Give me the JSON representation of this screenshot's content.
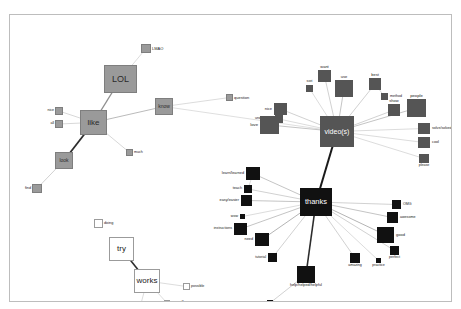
{
  "window": {
    "ghost_text_left": "",
    "ghost_text_right": ""
  },
  "chart_data": {
    "type": "scatter",
    "title": "",
    "subtitle": "",
    "xlabel": "",
    "ylabel": "",
    "legend_position": "none",
    "grid": false,
    "clusters": [
      {
        "id": "grey",
        "name": "grey-cluster",
        "color": "#9a9a9a",
        "hub": "like"
      },
      {
        "id": "darkgrey",
        "name": "dark-grey-cluster",
        "color": "#555555",
        "hub": "video(s)"
      },
      {
        "id": "black",
        "name": "black-cluster",
        "color": "#111111",
        "hub": "thanks"
      },
      {
        "id": "white",
        "name": "white-cluster",
        "color": "#ffffff",
        "hub": "works"
      }
    ],
    "nodes": [
      {
        "id": "lmao",
        "label": "LMAO",
        "x": 131,
        "y": 29,
        "w": 10,
        "h": 9,
        "cluster": "grey",
        "label_pos": "right",
        "fs": 4.0
      },
      {
        "id": "lol",
        "label": "LOL",
        "x": 94,
        "y": 50,
        "w": 33,
        "h": 28,
        "cluster": "grey",
        "label_pos": "inside",
        "fs": 9.0
      },
      {
        "id": "like",
        "label": "like",
        "x": 70,
        "y": 95,
        "w": 27,
        "h": 25,
        "cluster": "grey",
        "label_pos": "inside",
        "fs": 8.0
      },
      {
        "id": "know",
        "label": "know",
        "x": 145,
        "y": 83,
        "w": 18,
        "h": 17,
        "cluster": "grey",
        "label_pos": "inside",
        "fs": 5.0
      },
      {
        "id": "question",
        "label": "question",
        "x": 216,
        "y": 79,
        "w": 7,
        "h": 7,
        "cluster": "grey",
        "label_pos": "right",
        "fs": 4.0
      },
      {
        "id": "nice_left",
        "label": "nice",
        "x": 45,
        "y": 92,
        "w": 8,
        "h": 8,
        "cluster": "grey",
        "label_pos": "left",
        "fs": 3.6
      },
      {
        "id": "all",
        "label": "all",
        "x": 45,
        "y": 105,
        "w": 8,
        "h": 8,
        "cluster": "grey",
        "label_pos": "left",
        "fs": 3.6
      },
      {
        "id": "much",
        "label": "much",
        "x": 116,
        "y": 134,
        "w": 7,
        "h": 7,
        "cluster": "grey",
        "label_pos": "right",
        "fs": 3.6
      },
      {
        "id": "look",
        "label": "look",
        "x": 45,
        "y": 137,
        "w": 18,
        "h": 17,
        "cluster": "grey",
        "label_pos": "inside",
        "fs": 5.0
      },
      {
        "id": "find",
        "label": "find",
        "x": 22,
        "y": 169,
        "w": 10,
        "h": 9,
        "cluster": "grey",
        "label_pos": "left",
        "fs": 3.8
      },
      {
        "id": "videos",
        "label": "video(s)",
        "x": 310,
        "y": 101,
        "w": 34,
        "h": 31,
        "cluster": "darkgrey",
        "label_pos": "inside",
        "fs": 7.0
      },
      {
        "id": "want",
        "label": "want",
        "x": 308,
        "y": 55,
        "w": 13,
        "h": 12,
        "cluster": "darkgrey",
        "label_pos": "top",
        "fs": 4.0
      },
      {
        "id": "use",
        "label": "use",
        "x": 325,
        "y": 65,
        "w": 18,
        "h": 17,
        "cluster": "darkgrey",
        "label_pos": "top",
        "fs": 4.0
      },
      {
        "id": "sori",
        "label": "sori",
        "x": 296,
        "y": 70,
        "w": 7,
        "h": 7,
        "cluster": "darkgrey",
        "label_pos": "top",
        "fs": 3.6
      },
      {
        "id": "best",
        "label": "best",
        "x": 359,
        "y": 63,
        "w": 12,
        "h": 12,
        "cluster": "darkgrey",
        "label_pos": "top",
        "fs": 4.0
      },
      {
        "id": "method",
        "label": "method",
        "x": 371,
        "y": 78,
        "w": 7,
        "h": 7,
        "cluster": "darkgrey",
        "label_pos": "right",
        "fs": 3.6
      },
      {
        "id": "show",
        "label": "show",
        "x": 378,
        "y": 89,
        "w": 12,
        "h": 12,
        "cluster": "darkgrey",
        "label_pos": "top",
        "fs": 4.0
      },
      {
        "id": "people",
        "label": "people",
        "x": 397,
        "y": 84,
        "w": 19,
        "h": 18,
        "cluster": "darkgrey",
        "label_pos": "top",
        "fs": 4.2
      },
      {
        "id": "solve",
        "label": "solve/solved",
        "x": 408,
        "y": 108,
        "w": 12,
        "h": 11,
        "cluster": "darkgrey",
        "label_pos": "right",
        "fs": 3.6
      },
      {
        "id": "cool",
        "label": "cool",
        "x": 408,
        "y": 122,
        "w": 12,
        "h": 11,
        "cluster": "darkgrey",
        "label_pos": "right",
        "fs": 3.8
      },
      {
        "id": "please",
        "label": "please",
        "x": 409,
        "y": 139,
        "w": 10,
        "h": 9,
        "cluster": "darkgrey",
        "label_pos": "bot",
        "fs": 3.6
      },
      {
        "id": "nice_right",
        "label": "nice",
        "x": 264,
        "y": 88,
        "w": 13,
        "h": 12,
        "cluster": "darkgrey",
        "label_pos": "left",
        "fs": 4.0
      },
      {
        "id": "understand",
        "label": "understand",
        "x": 265,
        "y": 100,
        "w": 8,
        "h": 8,
        "cluster": "darkgrey",
        "label_pos": "left",
        "fs": 3.6
      },
      {
        "id": "love",
        "label": "love",
        "x": 250,
        "y": 101,
        "w": 19,
        "h": 18,
        "cluster": "darkgrey",
        "label_pos": "left",
        "fs": 4.2
      },
      {
        "id": "thanks",
        "label": "thanks",
        "x": 290,
        "y": 173,
        "w": 32,
        "h": 28,
        "cluster": "black",
        "label_pos": "inside",
        "fs": 7.5
      },
      {
        "id": "learn",
        "label": "learn/learned",
        "x": 236,
        "y": 152,
        "w": 14,
        "h": 13,
        "cluster": "black",
        "label_pos": "left",
        "fs": 3.8
      },
      {
        "id": "teach",
        "label": "teach",
        "x": 234,
        "y": 170,
        "w": 8,
        "h": 8,
        "cluster": "black",
        "label_pos": "left",
        "fs": 3.8
      },
      {
        "id": "easy",
        "label": "easy/easier",
        "x": 231,
        "y": 180,
        "w": 11,
        "h": 11,
        "cluster": "black",
        "label_pos": "left",
        "fs": 3.8
      },
      {
        "id": "wow",
        "label": "wow",
        "x": 230,
        "y": 199,
        "w": 5,
        "h": 5,
        "cluster": "black",
        "label_pos": "left",
        "fs": 3.6
      },
      {
        "id": "instructions",
        "label": "instructions",
        "x": 224,
        "y": 208,
        "w": 13,
        "h": 12,
        "cluster": "black",
        "label_pos": "left",
        "fs": 3.6
      },
      {
        "id": "need",
        "label": "need",
        "x": 245,
        "y": 218,
        "w": 14,
        "h": 13,
        "cluster": "black",
        "label_pos": "left",
        "fs": 3.8
      },
      {
        "id": "tutorial",
        "label": "tutorial",
        "x": 258,
        "y": 238,
        "w": 9,
        "h": 9,
        "cluster": "black",
        "label_pos": "left",
        "fs": 3.6
      },
      {
        "id": "helphelped",
        "label": "help/helped/helpful",
        "x": 287,
        "y": 251,
        "w": 18,
        "h": 17,
        "cluster": "black",
        "label_pos": "bot",
        "fs": 3.8
      },
      {
        "id": "problem",
        "label": "problem",
        "x": 257,
        "y": 285,
        "w": 6,
        "h": 6,
        "cluster": "black",
        "label_pos": "bot",
        "fs": 3.6
      },
      {
        "id": "amazing",
        "label": "amazing",
        "x": 340,
        "y": 238,
        "w": 10,
        "h": 10,
        "cluster": "black",
        "label_pos": "bot",
        "fs": 3.6
      },
      {
        "id": "practice",
        "label": "practice",
        "x": 366,
        "y": 243,
        "w": 5,
        "h": 5,
        "cluster": "black",
        "label_pos": "bot",
        "fs": 3.6
      },
      {
        "id": "perfect",
        "label": "perfect",
        "x": 380,
        "y": 231,
        "w": 9,
        "h": 9,
        "cluster": "black",
        "label_pos": "bot",
        "fs": 3.6
      },
      {
        "id": "good",
        "label": "good",
        "x": 367,
        "y": 212,
        "w": 17,
        "h": 16,
        "cluster": "black",
        "label_pos": "right",
        "fs": 4.0
      },
      {
        "id": "awesome",
        "label": "awesome",
        "x": 377,
        "y": 197,
        "w": 11,
        "h": 11,
        "cluster": "black",
        "label_pos": "right",
        "fs": 3.6
      },
      {
        "id": "omg",
        "label": "OMG",
        "x": 382,
        "y": 185,
        "w": 9,
        "h": 9,
        "cluster": "black",
        "label_pos": "right",
        "fs": 3.6
      },
      {
        "id": "doing",
        "label": "doing",
        "x": 84,
        "y": 204,
        "w": 9,
        "h": 9,
        "cluster": "white",
        "label_pos": "right",
        "fs": 3.8
      },
      {
        "id": "try",
        "label": "try",
        "x": 99,
        "y": 222,
        "w": 25,
        "h": 24,
        "cluster": "white",
        "label_pos": "inside",
        "fs": 8.0
      },
      {
        "id": "works",
        "label": "works",
        "x": 124,
        "y": 254,
        "w": 26,
        "h": 24,
        "cluster": "white",
        "label_pos": "inside",
        "fs": 8.0
      },
      {
        "id": "possible",
        "label": "possible",
        "x": 173,
        "y": 268,
        "w": 7,
        "h": 7,
        "cluster": "white",
        "label_pos": "right",
        "fs": 3.6
      },
      {
        "id": "better",
        "label": "better",
        "x": 126,
        "y": 286,
        "w": 9,
        "h": 9,
        "cluster": "white",
        "label_pos": "right",
        "fs": 3.6
      },
      {
        "id": "yourself",
        "label": "yourself",
        "x": 154,
        "y": 285,
        "w": 6,
        "h": 6,
        "cluster": "white",
        "label_pos": "right",
        "fs": 3.6
      }
    ],
    "edges": [
      {
        "source": "like",
        "target": "lol",
        "weight": 1.4,
        "color": "#8f8f8f"
      },
      {
        "source": "like",
        "target": "know",
        "weight": 0.8,
        "color": "#a8a8a8"
      },
      {
        "source": "like",
        "target": "nice_left",
        "weight": 0.6,
        "color": "#bdbdbd"
      },
      {
        "source": "like",
        "target": "all",
        "weight": 0.6,
        "color": "#bdbdbd"
      },
      {
        "source": "like",
        "target": "much",
        "weight": 0.6,
        "color": "#bdbdbd"
      },
      {
        "source": "like",
        "target": "look",
        "weight": 1.8,
        "color": "#2c2c2c"
      },
      {
        "source": "look",
        "target": "find",
        "weight": 0.7,
        "color": "#bdbdbd"
      },
      {
        "source": "lol",
        "target": "lmao",
        "weight": 0.6,
        "color": "#c4c4c4"
      },
      {
        "source": "know",
        "target": "question",
        "weight": 0.6,
        "color": "#c4c4c4"
      },
      {
        "source": "know",
        "target": "videos",
        "weight": 0.6,
        "color": "#c9c9c9"
      },
      {
        "source": "videos",
        "target": "want",
        "weight": 0.7,
        "color": "#bdbdbd"
      },
      {
        "source": "videos",
        "target": "use",
        "weight": 0.8,
        "color": "#b5b5b5"
      },
      {
        "source": "videos",
        "target": "sori",
        "weight": 0.6,
        "color": "#c4c4c4"
      },
      {
        "source": "videos",
        "target": "best",
        "weight": 0.7,
        "color": "#bdbdbd"
      },
      {
        "source": "videos",
        "target": "show",
        "weight": 0.7,
        "color": "#bdbdbd"
      },
      {
        "source": "videos",
        "target": "people",
        "weight": 0.8,
        "color": "#b5b5b5"
      },
      {
        "source": "videos",
        "target": "solve",
        "weight": 0.6,
        "color": "#c4c4c4"
      },
      {
        "source": "videos",
        "target": "cool",
        "weight": 0.6,
        "color": "#c4c4c4"
      },
      {
        "source": "videos",
        "target": "please",
        "weight": 0.6,
        "color": "#c4c4c4"
      },
      {
        "source": "videos",
        "target": "nice_right",
        "weight": 0.7,
        "color": "#bdbdbd"
      },
      {
        "source": "videos",
        "target": "understand",
        "weight": 0.6,
        "color": "#c4c4c4"
      },
      {
        "source": "videos",
        "target": "love",
        "weight": 0.8,
        "color": "#b5b5b5"
      },
      {
        "source": "best",
        "target": "method",
        "weight": 0.6,
        "color": "#c4c4c4"
      },
      {
        "source": "videos",
        "target": "thanks",
        "weight": 2.0,
        "color": "#1a1a1a"
      },
      {
        "source": "thanks",
        "target": "learn",
        "weight": 0.8,
        "color": "#b5b5b5"
      },
      {
        "source": "thanks",
        "target": "teach",
        "weight": 0.7,
        "color": "#bdbdbd"
      },
      {
        "source": "thanks",
        "target": "easy",
        "weight": 0.8,
        "color": "#b5b5b5"
      },
      {
        "source": "thanks",
        "target": "wow",
        "weight": 0.6,
        "color": "#c4c4c4"
      },
      {
        "source": "thanks",
        "target": "instructions",
        "weight": 0.8,
        "color": "#b5b5b5"
      },
      {
        "source": "thanks",
        "target": "need",
        "weight": 0.9,
        "color": "#ababab"
      },
      {
        "source": "thanks",
        "target": "tutorial",
        "weight": 0.7,
        "color": "#bdbdbd"
      },
      {
        "source": "thanks",
        "target": "helphelped",
        "weight": 1.6,
        "color": "#2c2c2c"
      },
      {
        "source": "thanks",
        "target": "amazing",
        "weight": 0.7,
        "color": "#bdbdbd"
      },
      {
        "source": "thanks",
        "target": "practice",
        "weight": 0.6,
        "color": "#c4c4c4"
      },
      {
        "source": "thanks",
        "target": "perfect",
        "weight": 0.7,
        "color": "#bdbdbd"
      },
      {
        "source": "thanks",
        "target": "good",
        "weight": 0.9,
        "color": "#ababab"
      },
      {
        "source": "thanks",
        "target": "awesome",
        "weight": 0.8,
        "color": "#b5b5b5"
      },
      {
        "source": "thanks",
        "target": "omg",
        "weight": 0.7,
        "color": "#bdbdbd"
      },
      {
        "source": "helphelped",
        "target": "problem",
        "weight": 0.7,
        "color": "#bdbdbd"
      },
      {
        "source": "learn",
        "target": "teach",
        "weight": 0.6,
        "color": "#c4c4c4"
      },
      {
        "source": "try",
        "target": "works",
        "weight": 1.6,
        "color": "#2c2c2c"
      },
      {
        "source": "works",
        "target": "possible",
        "weight": 0.6,
        "color": "#c4c4c4"
      },
      {
        "source": "works",
        "target": "better",
        "weight": 0.6,
        "color": "#c4c4c4"
      },
      {
        "source": "works",
        "target": "yourself",
        "weight": 0.6,
        "color": "#c4c4c4"
      }
    ]
  }
}
